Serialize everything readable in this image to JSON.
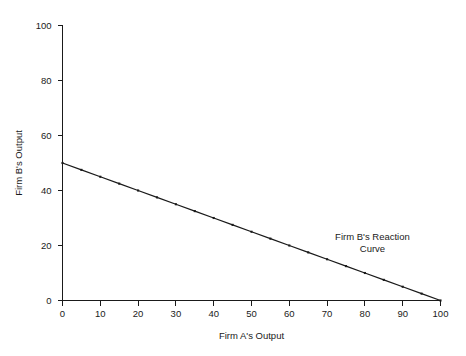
{
  "chart_data": {
    "type": "line",
    "title": "",
    "xlabel": "Firm A's Output",
    "ylabel": "Firm B's Output",
    "xlim": [
      0,
      100
    ],
    "ylim": [
      0,
      100
    ],
    "grid": false,
    "legend": false,
    "x_ticks": [
      0,
      10,
      20,
      30,
      40,
      50,
      60,
      70,
      80,
      90,
      100
    ],
    "y_ticks": [
      0,
      20,
      40,
      60,
      80,
      100
    ],
    "x_tick_labels": [
      "0",
      "10",
      "20",
      "30",
      "40",
      "50",
      "60",
      "70",
      "80",
      "90",
      "100"
    ],
    "y_tick_labels": [
      "0",
      "20",
      "40",
      "60",
      "80",
      "100"
    ],
    "series": [
      {
        "name": "Firm B's Reaction Curve",
        "marker": "square",
        "color": "#1a1a1a",
        "x": [
          0,
          5,
          10,
          15,
          20,
          25,
          30,
          35,
          40,
          45,
          50,
          55,
          60,
          65,
          70,
          75,
          80,
          85,
          90,
          95,
          100
        ],
        "values": [
          50,
          47.5,
          45,
          42.5,
          40,
          37.5,
          35,
          32.5,
          30,
          27.5,
          25,
          22.5,
          20,
          17.5,
          15,
          12.5,
          10,
          7.5,
          5,
          2.5,
          0
        ]
      }
    ],
    "annotations": [
      {
        "name": "reaction-curve-label",
        "lines": [
          "Firm B's Reaction",
          "Curve"
        ],
        "x": 82,
        "y": 22
      }
    ]
  }
}
